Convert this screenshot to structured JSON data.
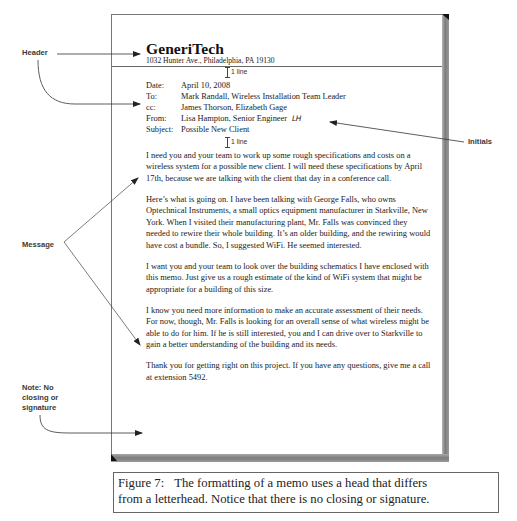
{
  "memo": {
    "company_name": "GeneriTech",
    "address": "1032 Hunter Ave., Philadelphia, PA 19130",
    "spacing_marks": [
      "1 line",
      "1 line"
    ],
    "fields": [
      {
        "label": "Date:",
        "value": "April 10, 2008"
      },
      {
        "label": "To:",
        "value": "Mark Randall, Wireless Installation Team Leader"
      },
      {
        "label": "cc:",
        "value": "James Thorson, Elizabeth Gage"
      },
      {
        "label": "From:",
        "value": "Lisa Hampton, Senior Engineer",
        "initials": "LH"
      },
      {
        "label": "Subject:",
        "value": "Possible New Client"
      }
    ],
    "paragraphs": [
      "I need you and your team to work up some rough specifications and costs on a wireless system for a possible new client. I will need these specifications by April 17th, because we are talking with the client that day in a conference call.",
      "Here’s what is going on. I have been talking with George Falls, who owns Optechnical Instruments, a small optics equipment manufacturer in Starkville, New York. When I visited their manufacturing plant, Mr. Falls was convinced they needed to rewire their whole building. It’s an older building, and the rewiring would have cost a bundle. So, I suggested WiFi. He seemed interested.",
      "I want you and your team to look over the building schematics I have enclosed with this memo. Just give us a rough estimate of the kind of WiFi system that might be appropriate for a building of this size.",
      "I know you need more information to make an accurate assessment of their needs. For now, though, Mr. Falls is looking for an overall sense of what wireless might be able to do for him. If he is still interested, you and I can drive over to Starkville to gain a better understanding of the building and its needs.",
      "Thank you for getting right on this project. If you have any questions, give me a call at extension 5492."
    ]
  },
  "callouts": {
    "header": "Header",
    "initials": "Initials",
    "message": "Message",
    "note_line1": "Note: No",
    "note_line2": "closing or",
    "note_line3": "signature"
  },
  "caption": {
    "figure_label": "Figure 7:",
    "line1": "The formatting of a memo uses a head that differs",
    "line2": "from a letterhead. Notice that there is no closing or signature."
  },
  "colors": {
    "callout_text": "#3a3a3a",
    "page_border": "#777777",
    "shadow": "#7c7c7c"
  }
}
